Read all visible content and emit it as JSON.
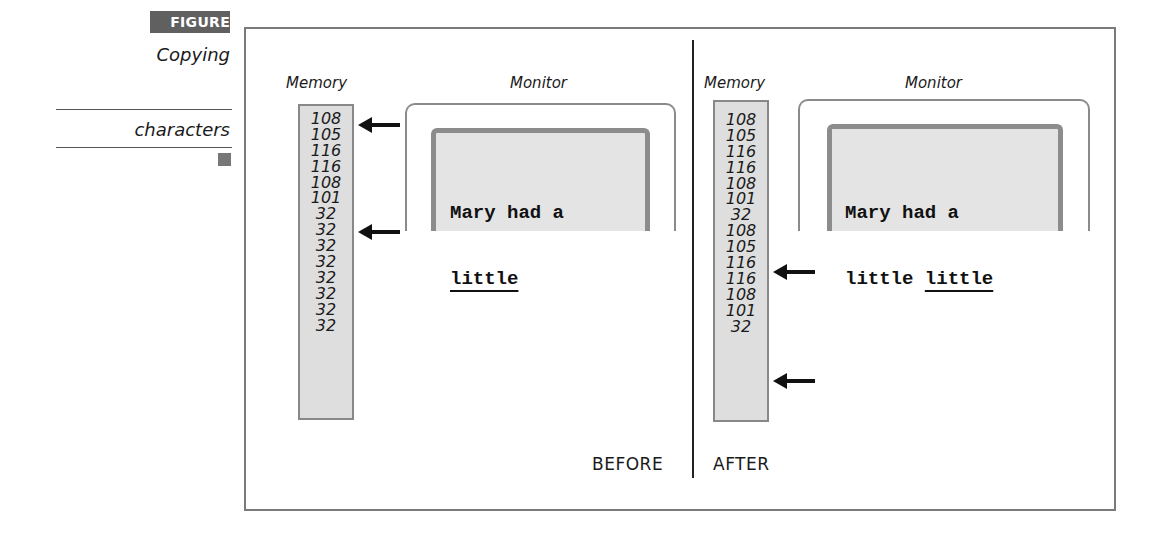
{
  "figure": {
    "badge": "FIGURE 16-3",
    "caption_lines": [
      "Copying",
      "characters"
    ]
  },
  "before": {
    "state_label": "BEFORE",
    "memory_label": "Memory",
    "monitor_label": "Monitor",
    "memory_values": [
      "108",
      "105",
      "116",
      "116",
      "108",
      "101",
      "32",
      "32",
      "32",
      "32",
      "32",
      "32",
      "32",
      "32"
    ],
    "arrows_at_rows": [
      0,
      5
    ],
    "screen_lines": [
      "Mary had a",
      "little"
    ],
    "underlined_text": "little"
  },
  "after": {
    "state_label": "AFTER",
    "memory_label": "Memory",
    "monitor_label": "Monitor",
    "memory_values": [
      "108",
      "105",
      "116",
      "116",
      "108",
      "101",
      "32",
      "108",
      "105",
      "116",
      "116",
      "108",
      "101",
      "32"
    ],
    "arrows_at_rows": [
      7,
      12
    ],
    "screen_line1": "Mary had a",
    "screen_line2_plain": "little ",
    "screen_line2_underlined": "little"
  },
  "colors": {
    "badge_bg": "#606060",
    "memory_bg": "#dedede",
    "screen_bg": "#e4e4e4",
    "screen_border": "#8c8c8c",
    "frame": "#7a7a7a"
  }
}
